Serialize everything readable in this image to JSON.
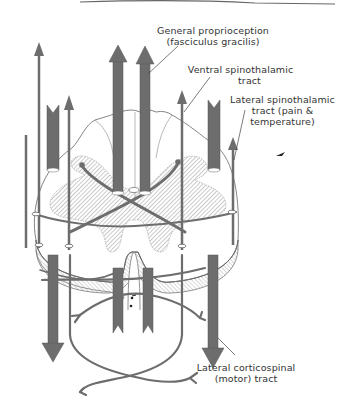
{
  "diagram": {
    "colors": {
      "tract": "#6d6d6d",
      "tract_dark": "#5a5a5a",
      "outline": "#777777",
      "hatch": "#8a8a8a",
      "text": "#333333",
      "background": "#ffffff"
    },
    "labels": {
      "general_proprioception": {
        "line1": "General proprioception",
        "line2": "(fasciculus gracilis)"
      },
      "ventral_spinothalamic": {
        "line1": "Ventral spinothalamic",
        "line2": "tract"
      },
      "lateral_spinothalamic": {
        "line1": "Lateral spinothalamic",
        "line2": "tract (pain &",
        "line3": "temperature)"
      },
      "lateral_corticospinal": {
        "line1": "Lateral corticospinal",
        "line2": "(motor) tract"
      }
    }
  }
}
